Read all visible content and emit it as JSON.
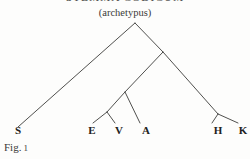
{
  "figure": {
    "heading": "STEMMA CODICUM",
    "archetype_label": "(archetypus)",
    "caption_prefix": "Fig.",
    "caption_number": "1",
    "line_color": "#3c3c3a",
    "text_color": "#222220",
    "background_color": "#fdfdfc"
  },
  "witnesses": [
    {
      "id": "S",
      "label": "S",
      "x": 18
    },
    {
      "id": "E",
      "label": "E",
      "x": 92
    },
    {
      "id": "V",
      "label": "V",
      "x": 119
    },
    {
      "id": "A",
      "label": "A",
      "x": 146
    },
    {
      "id": "H",
      "label": "H",
      "x": 218
    },
    {
      "id": "K",
      "label": "K",
      "x": 243
    }
  ],
  "nodes": {
    "archetype": {
      "x": 135,
      "y": 23
    },
    "beta": {
      "x": 163,
      "y": 52
    },
    "gamma": {
      "x": 125,
      "y": 92
    },
    "delta": {
      "x": 107,
      "y": 112
    },
    "epsilon": {
      "x": 218,
      "y": 114
    }
  },
  "edges": [
    {
      "name": "archetype-to-S",
      "x1": 135,
      "y1": 23,
      "x2": 18,
      "y2": 127
    },
    {
      "name": "archetype-to-beta",
      "x1": 135,
      "y1": 23,
      "x2": 163,
      "y2": 52
    },
    {
      "name": "beta-to-gamma",
      "x1": 163,
      "y1": 52,
      "x2": 125,
      "y2": 92
    },
    {
      "name": "beta-to-epsilon",
      "x1": 163,
      "y1": 52,
      "x2": 218,
      "y2": 114
    },
    {
      "name": "gamma-to-delta",
      "x1": 125,
      "y1": 92,
      "x2": 107,
      "y2": 112
    },
    {
      "name": "gamma-to-A",
      "x1": 125,
      "y1": 92,
      "x2": 140,
      "y2": 123
    },
    {
      "name": "delta-to-E",
      "x1": 107,
      "y1": 112,
      "x2": 93,
      "y2": 123
    },
    {
      "name": "delta-to-V",
      "x1": 107,
      "y1": 112,
      "x2": 115,
      "y2": 123
    },
    {
      "name": "epsilon-to-H",
      "x1": 218,
      "y1": 114,
      "x2": 212,
      "y2": 123
    },
    {
      "name": "epsilon-to-K",
      "x1": 218,
      "y1": 114,
      "x2": 238,
      "y2": 123
    }
  ]
}
